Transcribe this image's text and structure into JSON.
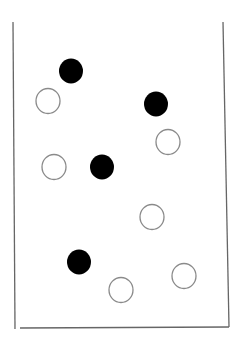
{
  "diagram": {
    "container": {
      "left_wall": {
        "x1": 13,
        "y1": 22,
        "x2": 15,
        "y2": 329
      },
      "right_wall": {
        "x1": 223,
        "y1": 22,
        "x2": 229,
        "y2": 327
      },
      "bottom": {
        "x1": 20,
        "y1": 328,
        "x2": 229,
        "y2": 327
      },
      "stroke": "#666666"
    },
    "particle_radius": 12,
    "particles": [
      {
        "type": "filled",
        "cx": 71,
        "cy": 71
      },
      {
        "type": "filled",
        "cx": 156,
        "cy": 104
      },
      {
        "type": "filled",
        "cx": 102,
        "cy": 167
      },
      {
        "type": "filled",
        "cx": 79,
        "cy": 262
      },
      {
        "type": "open",
        "cx": 48,
        "cy": 101
      },
      {
        "type": "open",
        "cx": 168,
        "cy": 142
      },
      {
        "type": "open",
        "cx": 54,
        "cy": 167
      },
      {
        "type": "open",
        "cx": 152,
        "cy": 217
      },
      {
        "type": "open",
        "cx": 121,
        "cy": 290
      },
      {
        "type": "open",
        "cx": 184,
        "cy": 276
      }
    ],
    "colors": {
      "filled": "#000000",
      "open_fill": "#ffffff",
      "open_stroke": "#8a8a8a"
    },
    "counts": {
      "filled": 4,
      "open": 6
    }
  }
}
